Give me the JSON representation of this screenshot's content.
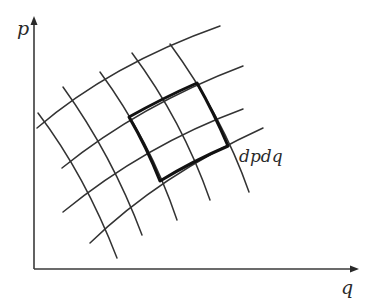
{
  "diagram": {
    "type": "phase-space-grid",
    "axes": {
      "vertical_label": "p",
      "horizontal_label": "q"
    },
    "cell_label": "dpdq",
    "colors": {
      "background": "#ffffff",
      "lines": "#333333",
      "highlight": "#111111"
    },
    "grid": {
      "p_curves": [
        {
          "d": "M37,128 Q110,65 220,26"
        },
        {
          "d": "M62,168 Q140,105 243,66"
        },
        {
          "d": "M63,212 Q145,145 243,109"
        },
        {
          "d": "M90,243 Q160,175 263,128"
        }
      ],
      "q_curves": [
        {
          "d": "M38,113 Q85,175 117,258"
        },
        {
          "d": "M63,87 Q112,155 142,235"
        },
        {
          "d": "M100,72 Q150,140 177,220"
        },
        {
          "d": "M132,53 Q182,120 210,200"
        },
        {
          "d": "M170,44 Q222,115 249,192"
        }
      ]
    },
    "highlighted_cell": {
      "d": "M129,117 Q163,98 197,83 Q214,113 228,146 Q193,161 160,181 Q147,148 129,117 Z"
    }
  }
}
